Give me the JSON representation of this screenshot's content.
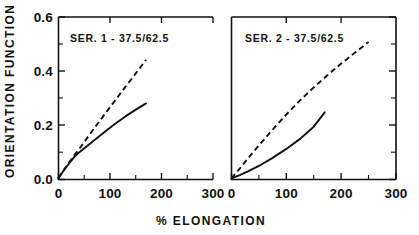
{
  "chart_data": {
    "type": "line",
    "title": "",
    "xlabel": "% ELONGATION",
    "ylabel": "ORIENTATION FUNCTION",
    "xlim": [
      0,
      300
    ],
    "ylim": [
      0.0,
      0.6
    ],
    "xticks": [
      0,
      100,
      200,
      300
    ],
    "xticklabels": [
      "0",
      "100",
      "200",
      "300"
    ],
    "yticks": [
      0.0,
      0.2,
      0.4,
      0.6
    ],
    "yticklabels": [
      "0.0",
      "0.2",
      "0.4",
      "0.6"
    ],
    "y_minor_ticks": [
      0.1,
      0.3,
      0.5
    ],
    "x_minor_ticks": [
      50,
      150,
      250
    ],
    "grid": false,
    "legend": "none",
    "line_color": "#111111",
    "panels": [
      {
        "name": "panel-1",
        "label": "SER. 1 - 37.5/62.5",
        "series": [
          {
            "name": "dashed",
            "style": "dashed",
            "x": [
              0,
              10,
              20,
              30,
              40,
              55,
              70,
              90,
              110,
              130,
              150,
              170
            ],
            "y": [
              0.005,
              0.035,
              0.062,
              0.088,
              0.112,
              0.152,
              0.191,
              0.242,
              0.292,
              0.342,
              0.392,
              0.442
            ]
          },
          {
            "name": "solid",
            "style": "solid",
            "x": [
              0,
              10,
              20,
              30,
              40,
              55,
              70,
              90,
              110,
              130,
              150,
              170
            ],
            "y": [
              0.005,
              0.033,
              0.058,
              0.082,
              0.1,
              0.123,
              0.146,
              0.176,
              0.206,
              0.233,
              0.258,
              0.281
            ]
          }
        ]
      },
      {
        "name": "panel-2",
        "label": "SER. 2 - 37.5/62.5",
        "series": [
          {
            "name": "dashed",
            "style": "dashed",
            "x": [
              0,
              15,
              30,
              50,
              75,
              100,
              125,
              150,
              175,
              200,
              225,
              250
            ],
            "y": [
              0.004,
              0.04,
              0.078,
              0.126,
              0.184,
              0.24,
              0.292,
              0.34,
              0.385,
              0.428,
              0.468,
              0.508
            ]
          },
          {
            "name": "solid",
            "style": "solid",
            "x": [
              0,
              15,
              30,
              50,
              75,
              100,
              125,
              150,
              170
            ],
            "y": [
              0.004,
              0.016,
              0.03,
              0.05,
              0.08,
              0.113,
              0.15,
              0.195,
              0.248
            ]
          }
        ]
      }
    ]
  },
  "axes": {
    "y_title": "ORIENTATION FUNCTION",
    "x_title": "% ELONGATION",
    "y_labels": [
      "0.6",
      "0.4",
      "0.2",
      "0.0"
    ],
    "panel1_x_labels": [
      "0",
      "100",
      "200",
      "300"
    ],
    "panel2_x_labels": [
      "0",
      "100",
      "200",
      "300"
    ]
  },
  "panel_labels": {
    "left": "SER. 1 - 37.5/62.5",
    "right": "SER. 2 - 37.5/62.5"
  }
}
